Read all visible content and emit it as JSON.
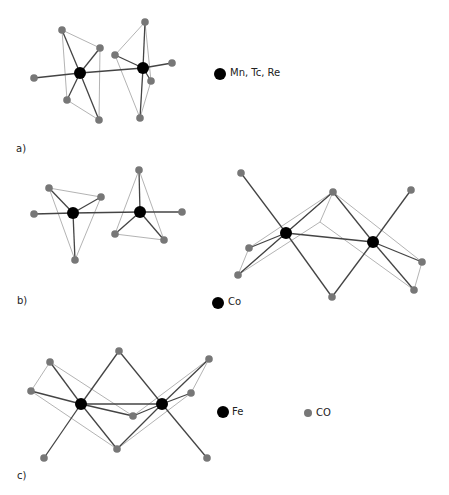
{
  "colors": {
    "metal": "#000000",
    "co": "#777777",
    "bond_dark": "#444444",
    "bond_light": "#aaaaaa"
  },
  "panels": {
    "a": {
      "label": "a)",
      "legend": "Mn, Tc, Re"
    },
    "b": {
      "label": "b)",
      "legend": "Co"
    },
    "c": {
      "label": "c)",
      "legend_metal": "Fe",
      "legend_co": "CO"
    }
  },
  "structures": [
    {
      "id": "a",
      "metals": [
        [
          80,
          73
        ],
        [
          143,
          68
        ]
      ],
      "co": [
        [
          34,
          78
        ],
        [
          62,
          30
        ],
        [
          100,
          48
        ],
        [
          67,
          100
        ],
        [
          99,
          120
        ],
        [
          115,
          55
        ],
        [
          145,
          22
        ],
        [
          172,
          63
        ],
        [
          151,
          81
        ],
        [
          140,
          118
        ]
      ],
      "dark": [
        [
          0,
          1
        ],
        [
          0,
          "c0"
        ],
        [
          0,
          "c1"
        ],
        [
          0,
          "c2"
        ],
        [
          0,
          "c3"
        ],
        [
          0,
          "c4"
        ],
        [
          1,
          "c5"
        ],
        [
          1,
          "c6"
        ],
        [
          1,
          "c7"
        ],
        [
          1,
          "c8"
        ],
        [
          1,
          "c9"
        ]
      ],
      "light": [
        [
          "c1",
          "c2"
        ],
        [
          "c1",
          "c3"
        ],
        [
          "c2",
          "c4"
        ],
        [
          "c3",
          "c4"
        ],
        [
          "c5",
          "c6"
        ],
        [
          "c6",
          "c8"
        ],
        [
          "c5",
          "c9"
        ],
        [
          "c8",
          "c9"
        ]
      ]
    },
    {
      "id": "b1",
      "metals": [
        [
          73,
          213
        ],
        [
          140,
          212
        ]
      ],
      "co": [
        [
          34,
          214
        ],
        [
          49,
          188
        ],
        [
          101,
          197
        ],
        [
          75,
          260
        ],
        [
          139,
          170
        ],
        [
          182,
          212
        ],
        [
          115,
          234
        ],
        [
          164,
          240
        ]
      ],
      "dark": [
        [
          0,
          1
        ],
        [
          0,
          "c0"
        ],
        [
          0,
          "c1"
        ],
        [
          0,
          "c2"
        ],
        [
          0,
          "c3"
        ],
        [
          1,
          "c4"
        ],
        [
          1,
          "c5"
        ],
        [
          1,
          "c6"
        ],
        [
          1,
          "c7"
        ]
      ],
      "light": [
        [
          "c1",
          "c2"
        ],
        [
          "c1",
          "c3"
        ],
        [
          "c2",
          "c3"
        ],
        [
          "c4",
          "c6"
        ],
        [
          "c4",
          "c7"
        ],
        [
          "c6",
          "c7"
        ]
      ]
    },
    {
      "id": "b2",
      "metals": [
        [
          286,
          233
        ],
        [
          373,
          242
        ]
      ],
      "co": [
        [
          241,
          173
        ],
        [
          333,
          192
        ],
        [
          411,
          190
        ],
        [
          249,
          248
        ],
        [
          238,
          275
        ],
        [
          332,
          297
        ],
        [
          422,
          262
        ],
        [
          414,
          290
        ],
        [
          320,
          222
        ]
      ],
      "dark": [
        [
          0,
          1
        ],
        [
          0,
          "c0"
        ],
        [
          0,
          "c1"
        ],
        [
          0,
          "c3"
        ],
        [
          0,
          "c4"
        ],
        [
          0,
          "c5"
        ],
        [
          1,
          "c1"
        ],
        [
          1,
          "c2"
        ],
        [
          1,
          "c5"
        ],
        [
          1,
          "c6"
        ],
        [
          1,
          "c7"
        ]
      ],
      "light": [
        [
          "c1",
          "c3"
        ],
        [
          "c1",
          "c4"
        ],
        [
          "c3",
          "c4"
        ],
        [
          "c1",
          "c8"
        ],
        [
          "c8",
          "c4"
        ],
        [
          "c8",
          "c7"
        ],
        [
          "c1",
          "c6"
        ],
        [
          "c6",
          "c7"
        ]
      ]
    },
    {
      "id": "c",
      "metals": [
        [
          81,
          404
        ],
        [
          162,
          404
        ]
      ],
      "co": [
        [
          50,
          362
        ],
        [
          119,
          351
        ],
        [
          209,
          359
        ],
        [
          31,
          391
        ],
        [
          191,
          393
        ],
        [
          133,
          416
        ],
        [
          117,
          449
        ],
        [
          44,
          458
        ],
        [
          207,
          458
        ]
      ],
      "dark": [
        [
          0,
          1
        ],
        [
          0,
          "c0"
        ],
        [
          0,
          "c1"
        ],
        [
          0,
          "c3"
        ],
        [
          0,
          "c5"
        ],
        [
          0,
          "c6"
        ],
        [
          0,
          "c7"
        ],
        [
          1,
          "c1"
        ],
        [
          1,
          "c2"
        ],
        [
          1,
          "c4"
        ],
        [
          1,
          "c5"
        ],
        [
          1,
          "c6"
        ],
        [
          1,
          "c8"
        ]
      ],
      "light": [
        [
          "c0",
          "c3"
        ],
        [
          "c0",
          "c5"
        ],
        [
          "c3",
          "c6"
        ],
        [
          "c2",
          "c4"
        ],
        [
          "c2",
          "c5"
        ],
        [
          "c4",
          "c6"
        ]
      ]
    }
  ]
}
